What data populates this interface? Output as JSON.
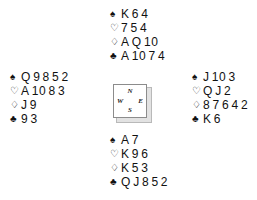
{
  "diagram": {
    "type": "bridge-hand-deal",
    "suit_glyphs": {
      "spades": "♠",
      "hearts": "♡",
      "diamonds": "♢",
      "clubs": "♣"
    },
    "compass": {
      "north": "N",
      "east": "E",
      "south": "S",
      "west": "W"
    },
    "colors": {
      "background": "#ffffff",
      "text": "#111111",
      "box_border": "#8c8c8c",
      "box_shadow": "#e2e2e2"
    },
    "hands": {
      "north": {
        "label": "North",
        "suits": [
          {
            "suit": "spades",
            "glyph": "♠",
            "hollow": false,
            "cards": [
              "K",
              "6",
              "4"
            ]
          },
          {
            "suit": "hearts",
            "glyph": "♡",
            "hollow": true,
            "cards": [
              "7",
              "5",
              "4"
            ]
          },
          {
            "suit": "diamonds",
            "glyph": "♢",
            "hollow": true,
            "cards": [
              "A",
              "Q",
              "10"
            ]
          },
          {
            "suit": "clubs",
            "glyph": "♣",
            "hollow": false,
            "cards": [
              "A",
              "10",
              "7",
              "4"
            ]
          }
        ]
      },
      "west": {
        "label": "West",
        "suits": [
          {
            "suit": "spades",
            "glyph": "♠",
            "hollow": false,
            "cards": [
              "Q",
              "9",
              "8",
              "5",
              "2"
            ]
          },
          {
            "suit": "hearts",
            "glyph": "♡",
            "hollow": true,
            "cards": [
              "A",
              "10",
              "8",
              "3"
            ]
          },
          {
            "suit": "diamonds",
            "glyph": "♢",
            "hollow": true,
            "cards": [
              "J",
              "9"
            ]
          },
          {
            "suit": "clubs",
            "glyph": "♣",
            "hollow": false,
            "cards": [
              "9",
              "3"
            ]
          }
        ]
      },
      "east": {
        "label": "East",
        "suits": [
          {
            "suit": "spades",
            "glyph": "♠",
            "hollow": false,
            "cards": [
              "J",
              "10",
              "3"
            ]
          },
          {
            "suit": "hearts",
            "glyph": "♡",
            "hollow": true,
            "cards": [
              "Q",
              "J",
              "2"
            ]
          },
          {
            "suit": "diamonds",
            "glyph": "♢",
            "hollow": true,
            "cards": [
              "8",
              "7",
              "6",
              "4",
              "2"
            ]
          },
          {
            "suit": "clubs",
            "glyph": "♣",
            "hollow": false,
            "cards": [
              "K",
              "6"
            ]
          }
        ]
      },
      "south": {
        "label": "South",
        "suits": [
          {
            "suit": "spades",
            "glyph": "♠",
            "hollow": false,
            "cards": [
              "A",
              "7"
            ]
          },
          {
            "suit": "hearts",
            "glyph": "♡",
            "hollow": true,
            "cards": [
              "K",
              "9",
              "6"
            ]
          },
          {
            "suit": "diamonds",
            "glyph": "♢",
            "hollow": true,
            "cards": [
              "K",
              "5",
              "3"
            ]
          },
          {
            "suit": "clubs",
            "glyph": "♣",
            "hollow": false,
            "cards": [
              "Q",
              "J",
              "8",
              "5",
              "2"
            ]
          }
        ]
      }
    }
  }
}
